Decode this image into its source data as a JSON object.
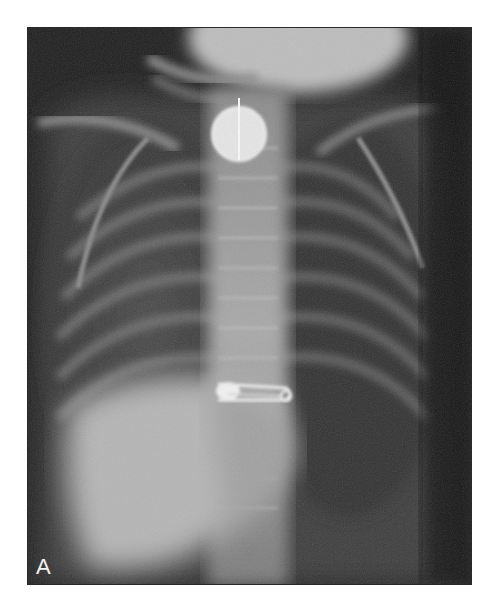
{
  "figure": {
    "panel_label": "A",
    "findings": [
      {
        "name": "coin",
        "location": "upper esophagus / thoracic inlet"
      },
      {
        "name": "safety pin",
        "location": "lower esophagus, open-ended, horizontal"
      }
    ],
    "colors": {
      "background": "#ffffff",
      "film_dark": "#161616",
      "bone_light": "#d8d8d8"
    }
  }
}
